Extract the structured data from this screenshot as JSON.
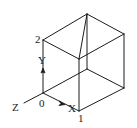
{
  "diagram": {
    "type": "isometric-cube-with-axes",
    "colors": {
      "line": "#1c1c1c",
      "text": "#222222",
      "background": "#ffffff"
    },
    "vertices": {
      "origin": [
        43,
        93
      ],
      "p2": [
        43,
        40
      ],
      "top": [
        87,
        14
      ],
      "top_right": [
        124,
        34
      ],
      "front_top": [
        79,
        59
      ],
      "bottom_right": [
        124,
        88
      ],
      "front_bottom": [
        79,
        111
      ],
      "inner": [
        87,
        69
      ],
      "z_end": [
        24,
        103
      ]
    },
    "edges": [
      [
        "p2",
        "top"
      ],
      [
        "top",
        "top_right"
      ],
      [
        "p2",
        "front_top"
      ],
      [
        "front_top",
        "top_right"
      ],
      [
        "top",
        "front_top"
      ],
      [
        "top",
        "inner"
      ],
      [
        "top_right",
        "bottom_right"
      ],
      [
        "front_top",
        "front_bottom"
      ],
      [
        "origin",
        "inner"
      ],
      [
        "inner",
        "bottom_right"
      ],
      [
        "origin",
        "front_bottom"
      ],
      [
        "front_bottom",
        "bottom_right"
      ],
      [
        "p2",
        "origin"
      ],
      [
        "z_end",
        "origin"
      ]
    ],
    "labels": {
      "point_2": "2",
      "point_0": "0",
      "point_1": "1",
      "axis_x": "X",
      "axis_y": "Y",
      "axis_z": "Z"
    },
    "label_positions": {
      "point_2": [
        35,
        43
      ],
      "point_0": [
        39,
        107
      ],
      "point_1": [
        78,
        122
      ],
      "axis_x": [
        68,
        112
      ],
      "axis_y": [
        38,
        64
      ],
      "axis_z": [
        12,
        111
      ]
    },
    "arrows": {
      "y_arrow": [
        43,
        72
      ],
      "x_arrow": [
        62,
        103
      ]
    }
  }
}
